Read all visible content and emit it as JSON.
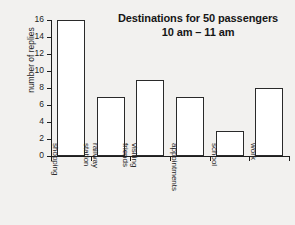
{
  "chart_data": {
    "type": "bar",
    "title": "Destinations for 50 passengers",
    "subtitle": "10 am – 11 am",
    "xlabel": "",
    "ylabel": "number of replies",
    "categories": [
      "shopping",
      "railway station",
      "visiting friends",
      "appointments",
      "school",
      "work"
    ],
    "category_lines": [
      [
        "shopping"
      ],
      [
        "railway",
        "station"
      ],
      [
        "visiting",
        "friends"
      ],
      [
        "appointments"
      ],
      [
        "school"
      ],
      [
        "work"
      ]
    ],
    "values": [
      16,
      7,
      9,
      7,
      3,
      8
    ],
    "ylim": [
      0,
      16
    ],
    "ytick_step": 2,
    "ytick_labels": [
      "0",
      "2",
      "4",
      "6",
      "8",
      "10",
      "12",
      "14",
      "16"
    ],
    "grid": false,
    "legend": null,
    "total": 50,
    "colors": {
      "background": "#f2f1ef",
      "bar_fill": "#ffffff",
      "bar_stroke": "#2a2a2a",
      "axis": "#1d1d1d",
      "text": "#1d1d1d",
      "title": "#161616"
    }
  }
}
